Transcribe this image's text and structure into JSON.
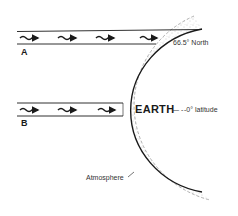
{
  "diagram": {
    "title": "",
    "beams": [
      {
        "id": "A",
        "label": "A",
        "arrows": 4
      },
      {
        "id": "B",
        "label": "B",
        "arrows": 3
      }
    ],
    "labels": {
      "north": "66.5° North",
      "earth": "EARTH",
      "equator_dash": "— -",
      "equator": "-0° latitude",
      "atmosphere": "Atmosphere"
    },
    "colors": {
      "ink": "#1a1a1a",
      "stipple": "#9a9a9a",
      "background": "#ffffff"
    }
  }
}
